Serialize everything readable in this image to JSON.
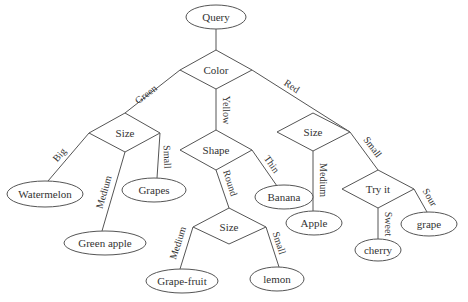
{
  "diagram": {
    "type": "decision-tree",
    "root": {
      "label": "Query",
      "x": 216,
      "y": 17
    },
    "decisions": [
      {
        "id": "color",
        "label": "Color",
        "x": 216,
        "y": 70
      },
      {
        "id": "size_green",
        "label": "Size",
        "x": 125,
        "y": 133
      },
      {
        "id": "shape",
        "label": "Shape",
        "x": 216,
        "y": 150
      },
      {
        "id": "size_red",
        "label": "Size",
        "x": 313,
        "y": 132
      },
      {
        "id": "tryit",
        "label": "Try it",
        "x": 378,
        "y": 189
      },
      {
        "id": "size_round",
        "label": "Size",
        "x": 229,
        "y": 227
      }
    ],
    "leaves": [
      {
        "id": "watermelon",
        "label": "Watermelon",
        "x": 45,
        "y": 194,
        "rx": 38
      },
      {
        "id": "grapes",
        "label": "Grapes",
        "x": 154,
        "y": 190,
        "rx": 32
      },
      {
        "id": "green_apple",
        "label": "Green apple",
        "x": 105,
        "y": 243,
        "rx": 41
      },
      {
        "id": "banana",
        "label": "Banana",
        "x": 284,
        "y": 197,
        "rx": 29
      },
      {
        "id": "grapefruit",
        "label": "Grape-fruit",
        "x": 182,
        "y": 281,
        "rx": 36
      },
      {
        "id": "lemon",
        "label": "lemon",
        "x": 277,
        "y": 279,
        "rx": 27
      },
      {
        "id": "apple",
        "label": "Apple",
        "x": 314,
        "y": 223,
        "rx": 28
      },
      {
        "id": "cherry",
        "label": "cherry",
        "x": 378,
        "y": 250,
        "rx": 23
      },
      {
        "id": "grape",
        "label": "grape",
        "x": 429,
        "y": 224,
        "rx": 28
      }
    ],
    "edges": [
      {
        "from": "root",
        "to": "color",
        "label": ""
      },
      {
        "from": "color",
        "to": "size_green",
        "label": "Green"
      },
      {
        "from": "color",
        "to": "shape",
        "label": "Yellow"
      },
      {
        "from": "color",
        "to": "size_red",
        "label": "Red"
      },
      {
        "from": "size_green",
        "to": "watermelon",
        "label": "Big"
      },
      {
        "from": "size_green",
        "to": "green_apple",
        "label": "Medium"
      },
      {
        "from": "size_green",
        "to": "grapes",
        "label": "Small"
      },
      {
        "from": "shape",
        "to": "size_round",
        "label": "Round"
      },
      {
        "from": "shape",
        "to": "banana",
        "label": "Thin"
      },
      {
        "from": "size_round",
        "to": "grapefruit",
        "label": "Medium"
      },
      {
        "from": "size_round",
        "to": "lemon",
        "label": "Small"
      },
      {
        "from": "size_red",
        "to": "apple",
        "label": "Medium"
      },
      {
        "from": "size_red",
        "to": "tryit",
        "label": "Small"
      },
      {
        "from": "tryit",
        "to": "cherry",
        "label": "Sweet"
      },
      {
        "from": "tryit",
        "to": "grape",
        "label": "Sour"
      }
    ]
  },
  "labels": {
    "root": "Query",
    "color": "Color",
    "size_green": "Size",
    "shape": "Shape",
    "size_red": "Size",
    "tryit": "Try it",
    "size_round": "Size",
    "watermelon": "Watermelon",
    "grapes": "Grapes",
    "green_apple": "Green apple",
    "banana": "Banana",
    "grapefruit": "Grape-fruit",
    "lemon": "lemon",
    "apple": "Apple",
    "cherry": "cherry",
    "grape": "grape",
    "edge_green": "Green",
    "edge_yellow": "Yellow",
    "edge_red": "Red",
    "edge_big": "Big",
    "edge_medium_green": "Medium",
    "edge_small_green": "Small",
    "edge_round": "Round",
    "edge_thin": "Thin",
    "edge_medium_round": "Medium",
    "edge_small_round": "Small",
    "edge_medium_red": "Medium",
    "edge_small_red": "Small",
    "edge_sweet": "Sweet",
    "edge_sour": "Sour"
  }
}
